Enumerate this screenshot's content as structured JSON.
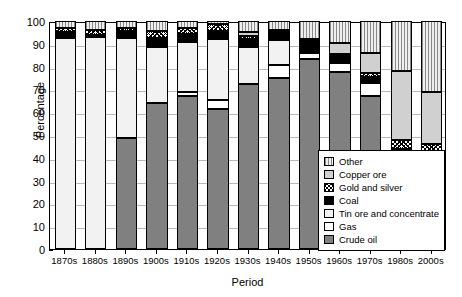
{
  "chart_data": {
    "type": "bar",
    "subtype": "stacked-bar-100",
    "title": "",
    "xlabel": "Period",
    "ylabel": "Percentage",
    "ylim": [
      0,
      100
    ],
    "ytick_step": 10,
    "yticks": [
      0,
      10,
      20,
      30,
      40,
      50,
      60,
      70,
      80,
      90,
      100
    ],
    "grid": true,
    "legend_position": "inside-bottom-right",
    "categories": [
      "1870s",
      "1880s",
      "1890s",
      "1900s",
      "1910s",
      "1920s",
      "1930s",
      "1940s",
      "1950s",
      "1960s",
      "1970s",
      "1980s",
      "2000s"
    ],
    "series": [
      {
        "name": "Crude oil",
        "pattern": "solid-dark-gray",
        "color": "#808080",
        "values": [
          0,
          0,
          48.5,
          64,
          67,
          61.5,
          72.5,
          75,
          83.5,
          77.5,
          67,
          9,
          3
        ]
      },
      {
        "name": "Gas",
        "pattern": "solid-white",
        "color": "#ffffff",
        "values": [
          0,
          0,
          0,
          0,
          2,
          4,
          0,
          5.5,
          2.5,
          4,
          6,
          22,
          13
        ]
      },
      {
        "name": "Tin ore and concentrate",
        "pattern": "solid-light",
        "color": "#f2f2f2",
        "values": [
          92.5,
          93,
          44,
          24.5,
          22,
          26.5,
          16,
          11,
          0,
          0,
          0,
          0,
          0
        ]
      },
      {
        "name": "Coal",
        "pattern": "solid-black",
        "color": "#000000",
        "values": [
          2.5,
          1,
          3,
          4,
          3.5,
          3.5,
          3.5,
          4.5,
          6,
          4,
          2.5,
          13,
          25
        ]
      },
      {
        "name": "Gold and silver",
        "pattern": "crosshatch",
        "color": "#ffffff",
        "values": [
          2,
          2,
          1.5,
          3,
          2.5,
          3,
          1.5,
          0,
          0,
          0,
          1.5,
          4,
          5
        ]
      },
      {
        "name": "Copper ore",
        "pattern": "solid-gray",
        "color": "#d0d0d0",
        "values": [
          0,
          0,
          0,
          0,
          0,
          0,
          1.5,
          0,
          0,
          5,
          9,
          30,
          23
        ]
      },
      {
        "name": "Other",
        "pattern": "vertical-lines",
        "color": "#e0e0e0",
        "values": [
          3,
          4,
          3,
          4.5,
          3,
          1.5,
          5,
          4,
          8,
          9.5,
          14,
          22,
          31
        ]
      }
    ]
  },
  "legend": {
    "items": [
      {
        "label": "Other"
      },
      {
        "label": "Copper ore"
      },
      {
        "label": "Gold and silver"
      },
      {
        "label": "Coal"
      },
      {
        "label": "Tin ore and concentrate"
      },
      {
        "label": "Gas"
      },
      {
        "label": "Crude oil"
      }
    ]
  }
}
